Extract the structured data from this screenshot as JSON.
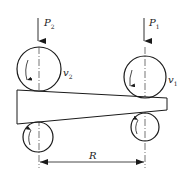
{
  "diagram": {
    "title": "",
    "labels": {
      "force_left": "P",
      "force_left_sub": "2",
      "force_right": "P",
      "force_right_sub": "1",
      "velocity_left": "v",
      "velocity_left_sub": "2",
      "velocity_right": "v",
      "velocity_right_sub": "1",
      "distance": "R"
    },
    "colors": {
      "stroke": "#1a1a1a",
      "background": "#ffffff"
    },
    "elements": [
      "upper-left-roller",
      "lower-left-roller",
      "upper-right-roller",
      "lower-right-roller",
      "tapered-strip",
      "force-arrow-P2",
      "force-arrow-P1",
      "dimension-R"
    ]
  }
}
